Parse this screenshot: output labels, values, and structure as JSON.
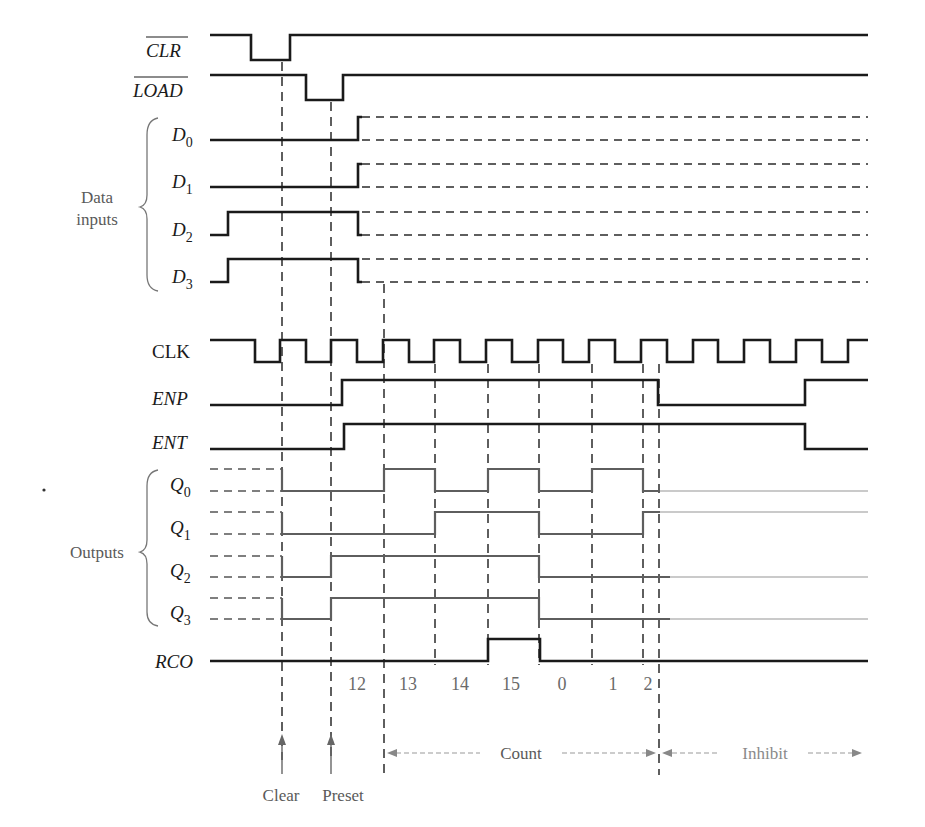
{
  "diagram": {
    "type": "timing-diagram",
    "signals": {
      "clr": {
        "label": "CLR",
        "overbar": true
      },
      "load": {
        "label": "LOAD",
        "overbar": true
      },
      "d0": {
        "label": "D",
        "sub": "0"
      },
      "d1": {
        "label": "D",
        "sub": "1"
      },
      "d2": {
        "label": "D",
        "sub": "2"
      },
      "d3": {
        "label": "D",
        "sub": "3"
      },
      "clk": {
        "label": "CLK"
      },
      "enp": {
        "label": "ENP"
      },
      "ent": {
        "label": "ENT"
      },
      "q0": {
        "label": "Q",
        "sub": "0"
      },
      "q1": {
        "label": "Q",
        "sub": "1"
      },
      "q2": {
        "label": "Q",
        "sub": "2"
      },
      "q3": {
        "label": "Q",
        "sub": "3"
      },
      "rco": {
        "label": "RCO"
      }
    },
    "groups": {
      "data_inputs": {
        "line1": "Data",
        "line2": "inputs"
      },
      "outputs": {
        "label": "Outputs"
      }
    },
    "count_sequence": [
      "12",
      "13",
      "14",
      "15",
      "0",
      "1",
      "2"
    ],
    "annotations": {
      "clear": "Clear",
      "preset": "Preset",
      "count": "Count",
      "inhibit": "Inhibit"
    }
  }
}
